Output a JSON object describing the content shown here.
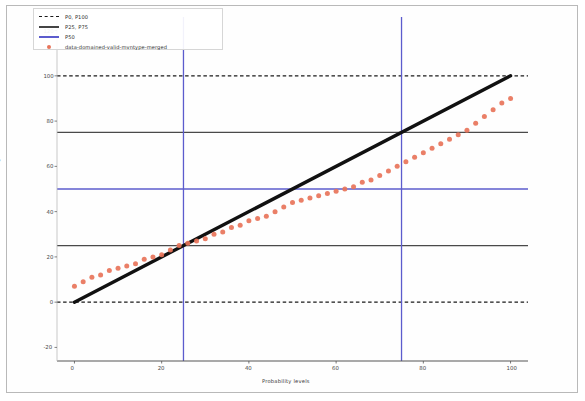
{
  "figure": {
    "title": "",
    "background_color": "#ffffff",
    "frame_color": "#b9b9b9"
  },
  "axes": {
    "xlabel": "Probability levels",
    "ylabel": "Percentage of data",
    "xticks": [
      "0",
      "20",
      "40",
      "60",
      "80",
      "100"
    ],
    "yticks": [
      "-20",
      "0",
      "20",
      "40",
      "60",
      "80",
      "100",
      "120"
    ]
  },
  "legend": {
    "entries": [
      {
        "label": "P0, P100",
        "style": "dashed-line",
        "color": "#1a1a1a"
      },
      {
        "label": "P25, P75",
        "style": "solid-line",
        "color": "#444444"
      },
      {
        "label": "P50",
        "style": "solid-line",
        "color": "#5c5ccd"
      },
      {
        "label": "data-domained-valid-mvntype-merged",
        "style": "marker",
        "color": "#e8745a"
      }
    ]
  },
  "chart_data": {
    "type": "scatter",
    "title": "",
    "xlabel": "Probability levels",
    "ylabel": "Percentage of data",
    "xlim": [
      -4,
      104
    ],
    "ylim": [
      -26,
      126
    ],
    "grid": false,
    "legend_position": "upper-left",
    "series": [
      {
        "name": "data-domained-valid-mvntype-merged",
        "type": "scatter",
        "color": "#e8745a",
        "marker": "circle",
        "x": [
          0,
          2,
          4,
          6,
          8,
          10,
          12,
          14,
          16,
          18,
          20,
          22,
          24,
          26,
          28,
          30,
          32,
          34,
          36,
          38,
          40,
          42,
          44,
          46,
          48,
          50,
          52,
          54,
          56,
          58,
          60,
          62,
          64,
          66,
          68,
          70,
          72,
          74,
          76,
          78,
          80,
          82,
          84,
          86,
          88,
          90,
          92,
          94,
          96,
          98,
          100
        ],
        "y": [
          7,
          9,
          11,
          12,
          14,
          15,
          16,
          17,
          19,
          20,
          21,
          23,
          25,
          26,
          27,
          28,
          30,
          31,
          33,
          34,
          36,
          37,
          38,
          40,
          42,
          44,
          45,
          46,
          47,
          48,
          49,
          50,
          51,
          53,
          54,
          56,
          58,
          60,
          62,
          64,
          66,
          68,
          70,
          72,
          74,
          76,
          79,
          82,
          85,
          88,
          90
        ]
      },
      {
        "name": "P25, P75",
        "type": "reference-line-horizontal",
        "color": "#444444",
        "values": [
          25,
          75
        ]
      },
      {
        "name": "P0, P100",
        "type": "reference-line-horizontal-dashed",
        "color": "#1a1a1a",
        "values": [
          0,
          100
        ]
      },
      {
        "name": "P50",
        "type": "reference-line",
        "color": "#5c5ccd",
        "horizontal_values": [
          50
        ],
        "vertical_values": [
          25,
          75
        ]
      },
      {
        "name": "identity",
        "type": "line",
        "color": "#111111",
        "x": [
          0,
          100
        ],
        "y": [
          0,
          100
        ]
      }
    ]
  }
}
